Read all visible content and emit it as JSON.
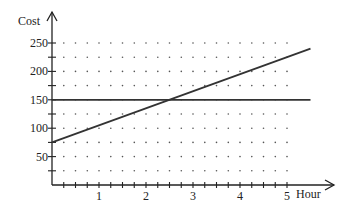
{
  "chart_data": {
    "type": "line",
    "title": "",
    "xlabel": "Hour",
    "ylabel": "Cost",
    "xlim": [
      0,
      5.5
    ],
    "ylim": [
      0,
      250
    ],
    "x_ticks": [
      1,
      2,
      3,
      4,
      5
    ],
    "x_minor_step": 0.25,
    "y_ticks": [
      50,
      100,
      150,
      200,
      250
    ],
    "y_minor_step": 25,
    "grid": "dotted",
    "legend": null,
    "series": [
      {
        "name": "Flat cost",
        "equation": "y = 150",
        "x": [
          0,
          5.5
        ],
        "values": [
          150,
          150
        ]
      },
      {
        "name": "Hourly cost",
        "equation": "y = 75 + 30x",
        "x": [
          0,
          5.5
        ],
        "values": [
          75,
          240
        ]
      }
    ],
    "annotations": [
      {
        "type": "intersection",
        "x": 2.5,
        "y": 150
      }
    ]
  },
  "layout": {
    "origin_px": [
      52,
      185
    ],
    "px_per_x": 47,
    "px_per_y": 0.568,
    "x_axis_end_px": 334,
    "y_axis_top_px": 12,
    "dot_x_max": 5,
    "dot_y_min": 25,
    "dot_y_max": 250
  }
}
